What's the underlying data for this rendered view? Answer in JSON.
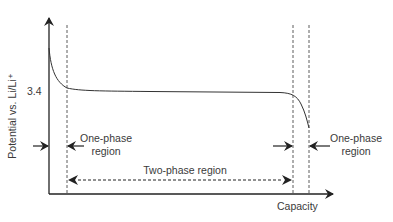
{
  "diagram": {
    "y_axis_label": "Potential vs. Li/Li⁺",
    "y_tick": "3.4",
    "x_axis_label": "Capacity",
    "left_region_label_line1": "One-phase",
    "left_region_label_line2": "region",
    "right_region_label_line1": "One-phase",
    "right_region_label_line2": "region",
    "middle_region_label": "Two-phase region",
    "colors": {
      "line": "#222222",
      "text": "#3a3a3a",
      "background": "#ffffff"
    }
  }
}
